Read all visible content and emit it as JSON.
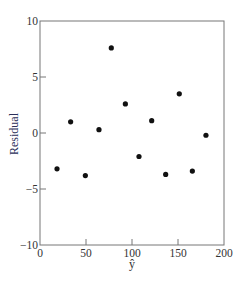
{
  "chart_data": {
    "type": "scatter",
    "title": "",
    "xlabel": "ŷ",
    "ylabel": "Residual",
    "xlim": [
      0,
      200
    ],
    "ylim": [
      -10,
      10
    ],
    "xticks": [
      0,
      50,
      100,
      150,
      200
    ],
    "yticks": [
      -10,
      -5,
      0,
      5,
      10
    ],
    "xtick_labels": [
      "0",
      "50",
      "100",
      "150",
      "200"
    ],
    "ytick_labels": [
      "−10",
      "−5",
      "0",
      "5",
      "10"
    ],
    "grid": false,
    "legend": null,
    "series": [
      {
        "name": "residuals",
        "color": "#111111",
        "points": [
          {
            "x": 18.5,
            "y": -3.2
          },
          {
            "x": 33.3,
            "y": 1.0
          },
          {
            "x": 49.3,
            "y": -3.8
          },
          {
            "x": 64.1,
            "y": 0.3
          },
          {
            "x": 77.5,
            "y": 7.6
          },
          {
            "x": 92.8,
            "y": 2.6
          },
          {
            "x": 107.6,
            "y": -2.1
          },
          {
            "x": 121.4,
            "y": 1.1
          },
          {
            "x": 136.6,
            "y": -3.7
          },
          {
            "x": 151.4,
            "y": 3.5
          },
          {
            "x": 165.6,
            "y": -3.4
          },
          {
            "x": 180.4,
            "y": -0.2
          }
        ]
      }
    ]
  },
  "colors": {
    "axis": "#777777",
    "tick_text": "#333333",
    "ylabel": "#2b2f5a",
    "xlabel": "#333333",
    "marker": "#111111"
  }
}
